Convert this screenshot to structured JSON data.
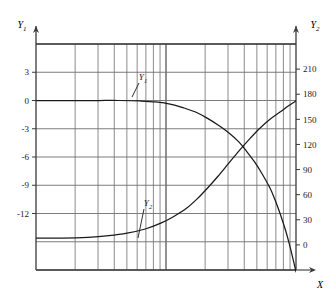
{
  "chart_data": {
    "type": "line",
    "title": "",
    "subtitle": "",
    "xlabel": "X",
    "ylabel": "Y1",
    "y2label": "Y2",
    "grid": true,
    "legend_position": "inline-annotations",
    "x_axis": {
      "scale": "log",
      "label": "X",
      "tick_labels": [],
      "decades": 2,
      "minor_ticks": [
        2,
        3,
        4,
        5,
        6,
        7,
        8,
        9
      ]
    },
    "y_axis_left": {
      "label": "Y1",
      "tick_labels": [
        "3",
        "0",
        "-3",
        "-6",
        "-9",
        "-12"
      ],
      "values": [
        3,
        0,
        -3,
        -6,
        -9,
        -12
      ],
      "ylim": [
        -18,
        6
      ]
    },
    "y_axis_right": {
      "label": "Y2",
      "tick_labels": [
        "210",
        "180",
        "150",
        "120",
        "90",
        "60",
        "30",
        "0"
      ],
      "values": [
        210,
        180,
        150,
        120,
        90,
        60,
        30,
        0
      ],
      "ylim": [
        -30,
        240
      ]
    },
    "series": [
      {
        "name": "Y1",
        "annotation": "Y1",
        "axis": "left",
        "points": [
          [
            0.0,
            0.0
          ],
          [
            0.08,
            0.0
          ],
          [
            0.16,
            0.0
          ],
          [
            0.24,
            0.0
          ],
          [
            0.32,
            0.0
          ],
          [
            0.4,
            -0.05
          ],
          [
            0.46,
            -0.15
          ],
          [
            0.52,
            -0.4
          ],
          [
            0.57,
            -0.8
          ],
          [
            0.62,
            -1.3
          ],
          [
            0.66,
            -1.9
          ],
          [
            0.7,
            -2.6
          ],
          [
            0.74,
            -3.4
          ],
          [
            0.78,
            -4.4
          ],
          [
            0.81,
            -5.4
          ],
          [
            0.84,
            -6.5
          ],
          [
            0.87,
            -7.8
          ],
          [
            0.9,
            -9.3
          ],
          [
            0.92,
            -10.6
          ],
          [
            0.94,
            -12.1
          ],
          [
            0.96,
            -13.8
          ],
          [
            0.975,
            -15.3
          ],
          [
            0.99,
            -17.0
          ],
          [
            1.0,
            -18.2
          ]
        ]
      },
      {
        "name": "Y2",
        "annotation": "Y2",
        "axis": "right",
        "points": [
          [
            0.0,
            8
          ],
          [
            0.1,
            8
          ],
          [
            0.2,
            9
          ],
          [
            0.28,
            11
          ],
          [
            0.35,
            14
          ],
          [
            0.42,
            19
          ],
          [
            0.48,
            26
          ],
          [
            0.53,
            34
          ],
          [
            0.58,
            44
          ],
          [
            0.62,
            55
          ],
          [
            0.66,
            68
          ],
          [
            0.7,
            82
          ],
          [
            0.74,
            97
          ],
          [
            0.78,
            112
          ],
          [
            0.82,
            126
          ],
          [
            0.86,
            139
          ],
          [
            0.9,
            150
          ],
          [
            0.94,
            159
          ],
          [
            0.97,
            166
          ],
          [
            1.0,
            172
          ]
        ]
      }
    ],
    "annotations": [
      {
        "text": "Y1",
        "series": "Y1",
        "x_px": 143,
        "y_px": 80,
        "leader_to_x_px": 132,
        "leader_to_y_px": 97
      },
      {
        "text": "Y2",
        "series": "Y2",
        "x_px": 148,
        "y_px": 206,
        "leader_to_x_px": 138,
        "leader_to_y_px": 238
      }
    ],
    "colors": {
      "curve": "#1a1a1a",
      "grid": "#6e6e6e",
      "frame": "#3a3a3a",
      "background": "#ffffff",
      "text": "#1a1a1a"
    }
  }
}
